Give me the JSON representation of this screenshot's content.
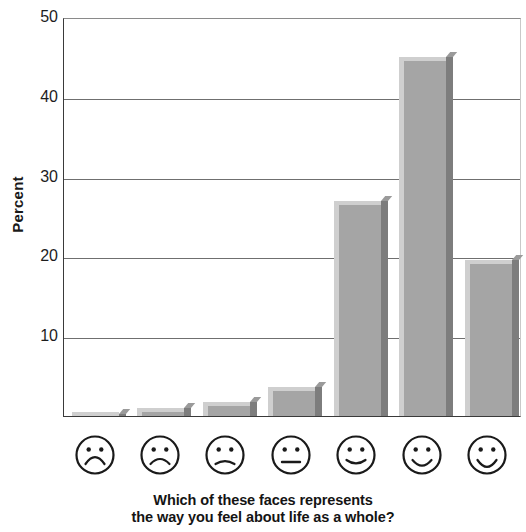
{
  "chart_data": {
    "type": "bar",
    "title": "",
    "subtitle": "",
    "xlabel": "Which of these faces represents the way you feel about life as a whole?",
    "ylabel": "Percent",
    "categories": [
      "very-sad-face",
      "sad-face",
      "slightly-sad-face",
      "neutral-face",
      "slightly-happy-face",
      "happy-face",
      "very-happy-face"
    ],
    "category_labels": [
      "face 1 (most unhappy)",
      "face 2",
      "face 3",
      "face 4 (neutral)",
      "face 5",
      "face 6",
      "face 7 (most happy)"
    ],
    "values": [
      0.2,
      1.0,
      1.8,
      3.6,
      27.0,
      45.0,
      19.6
    ],
    "ylim": [
      0,
      50
    ],
    "yticks": [
      10,
      20,
      30,
      40,
      50
    ],
    "ytick_labels": [
      "10",
      "20",
      "30",
      "40",
      "50"
    ],
    "grid": true,
    "grid_axis": "y",
    "legend": false,
    "bar_color": "#a5a5a5",
    "bar_highlight_color": "#cfcfcf",
    "bar_shadow_color": "#7d7d7d",
    "axis_color": "#3a3a3a",
    "text_color": "#1a1a1a"
  },
  "axis": {
    "y_title": "Percent"
  },
  "caption": {
    "line1": "Which of these faces represents",
    "line2": "the way you feel about life as a whole?"
  }
}
